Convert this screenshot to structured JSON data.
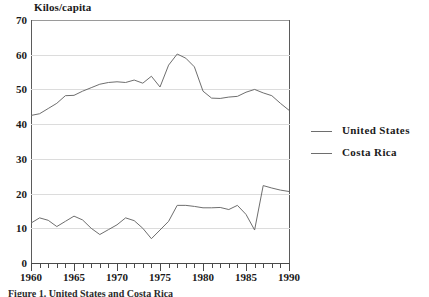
{
  "chart_data": {
    "type": "line",
    "title": "",
    "ylabel": "Kilos/capita",
    "xlabel": "",
    "ylim": [
      0,
      70
    ],
    "xlim": [
      1960,
      1990
    ],
    "yticks": [
      0,
      10,
      20,
      30,
      40,
      50,
      60,
      70
    ],
    "xticks": [
      1960,
      1965,
      1970,
      1975,
      1980,
      1985,
      1990
    ],
    "grid": "horizontal",
    "legend_position": "right",
    "x": [
      1960,
      1961,
      1962,
      1963,
      1964,
      1965,
      1966,
      1967,
      1968,
      1969,
      1970,
      1971,
      1972,
      1973,
      1974,
      1975,
      1976,
      1977,
      1978,
      1979,
      1980,
      1981,
      1982,
      1983,
      1984,
      1985,
      1986,
      1987,
      1988,
      1989,
      1990
    ],
    "series": [
      {
        "name": "United States",
        "values": [
          42.5,
          43.0,
          44.5,
          46.0,
          48.2,
          48.3,
          49.5,
          50.5,
          51.5,
          52.0,
          52.2,
          52.0,
          52.7,
          51.8,
          53.8,
          50.7,
          57.0,
          60.2,
          59.0,
          56.5,
          49.5,
          47.5,
          47.4,
          47.8,
          48.0,
          49.2,
          50.0,
          49.0,
          48.2,
          46.0,
          44.0
        ]
      },
      {
        "name": "Costa Rica",
        "values": [
          11.5,
          13.0,
          12.3,
          10.5,
          12.0,
          13.5,
          12.4,
          10.0,
          8.2,
          9.6,
          11.0,
          13.0,
          12.2,
          10.0,
          7.0,
          9.5,
          12.0,
          16.6,
          16.6,
          16.3,
          15.9,
          15.9,
          16.0,
          15.4,
          16.6,
          14.0,
          9.5,
          22.3,
          21.6,
          21.0,
          20.6
        ]
      }
    ]
  },
  "legend": {
    "entries": [
      {
        "label": "United States"
      },
      {
        "label": "Costa Rica"
      }
    ]
  },
  "caption": {
    "text": "Figure 1. United States and Costa Rica"
  }
}
